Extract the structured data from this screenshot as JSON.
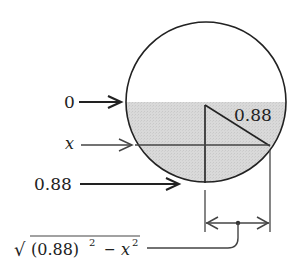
{
  "diagram": {
    "colors": {
      "stroke": "#222222",
      "fill_shaded": "#d6d6d6",
      "background": "#ffffff"
    },
    "labels": {
      "top_level": "0",
      "variable_level": "x",
      "bottom_level": "0.88",
      "radius": "0.88",
      "half_width_formula": {
        "sqrt": "√",
        "open": "(0.88)",
        "exp1": "2",
        "minus": "−",
        "var": "x",
        "exp2": "2"
      }
    },
    "geometry": {
      "circle": {
        "cx": 206,
        "cy": 102,
        "r": 80
      },
      "shaded_top_y": 102,
      "x_line_y": 145,
      "dimension_line_y": 223
    }
  }
}
